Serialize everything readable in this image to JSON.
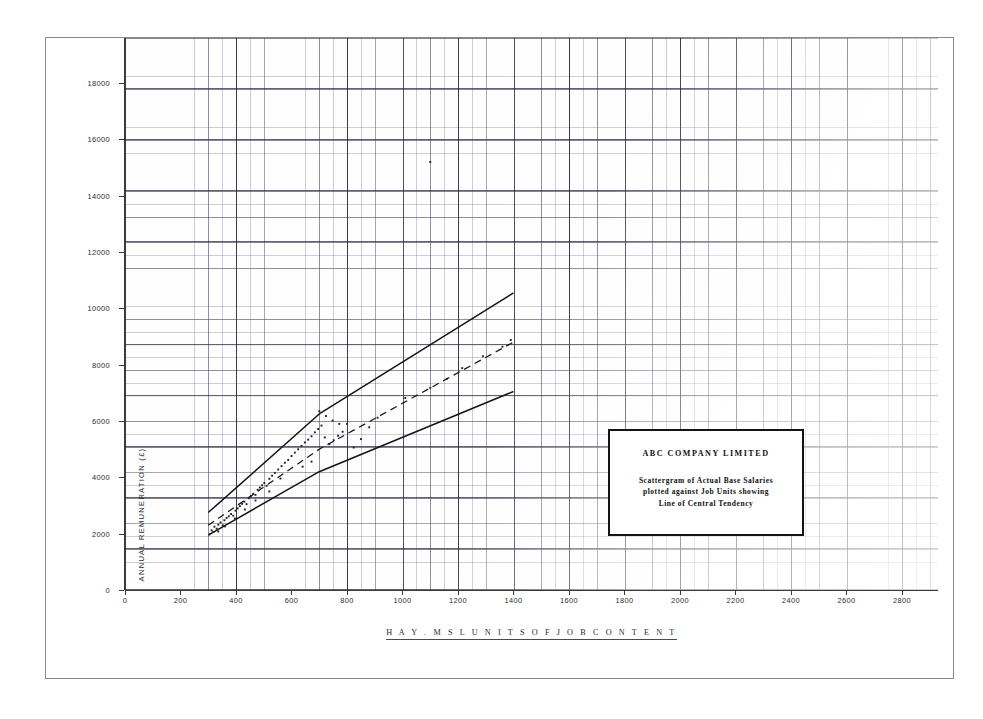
{
  "chart_data": {
    "type": "scatter",
    "title": "ABC COMPANY LIMITED",
    "xlabel": "H A Y . M S L   U N I T S   O F   J O B   C O N T E N T",
    "ylabel": "ANNUAL REMUNERATION (£)",
    "xlim": [
      0,
      2930
    ],
    "ylim": [
      0,
      19600
    ],
    "grid": true,
    "legend_position": "none",
    "x_ticks": [
      0,
      200,
      400,
      600,
      800,
      1000,
      1200,
      1400,
      1600,
      1800,
      2000,
      2200,
      2400,
      2600,
      2800
    ],
    "x_tick_labels": [
      "0",
      "200",
      "400",
      "600",
      "800",
      "1000",
      "1200",
      "1400",
      "1600",
      "1800",
      "2000",
      "2200",
      "2400",
      "2600",
      "2800"
    ],
    "y_ticks": [
      0,
      2000,
      4000,
      6000,
      8000,
      10000,
      12000,
      14000,
      16000,
      18000
    ],
    "y_tick_labels": [
      "0",
      "2000",
      "4000",
      "6000",
      "8000",
      "10000",
      "12000",
      "14000",
      "16000",
      "18000"
    ],
    "series": [
      {
        "name": "Upper Limit Line",
        "type": "line",
        "style": "solid",
        "points": [
          [
            300,
            2750
          ],
          [
            700,
            6250
          ],
          [
            1400,
            10550
          ]
        ]
      },
      {
        "name": "Line of Central Tendency",
        "type": "line",
        "style": "dashed",
        "points": [
          [
            300,
            2300
          ],
          [
            700,
            5000
          ],
          [
            1400,
            8800
          ]
        ]
      },
      {
        "name": "Lower Limit Line",
        "type": "line",
        "style": "solid",
        "points": [
          [
            300,
            1950
          ],
          [
            700,
            4200
          ],
          [
            1400,
            7050
          ]
        ]
      },
      {
        "name": "Actual Base Salaries",
        "type": "scatter",
        "points": [
          [
            305,
            1980
          ],
          [
            312,
            2120
          ],
          [
            318,
            2060
          ],
          [
            322,
            2250
          ],
          [
            330,
            2180
          ],
          [
            336,
            2320
          ],
          [
            344,
            2400
          ],
          [
            352,
            2300
          ],
          [
            358,
            2480
          ],
          [
            366,
            2560
          ],
          [
            374,
            2620
          ],
          [
            382,
            2700
          ],
          [
            390,
            2640
          ],
          [
            398,
            2820
          ],
          [
            406,
            2900
          ],
          [
            414,
            2980
          ],
          [
            422,
            3060
          ],
          [
            430,
            3140
          ],
          [
            438,
            3050
          ],
          [
            446,
            3260
          ],
          [
            454,
            3340
          ],
          [
            462,
            3420
          ],
          [
            470,
            3380
          ],
          [
            478,
            3560
          ],
          [
            486,
            3640
          ],
          [
            494,
            3720
          ],
          [
            502,
            3800
          ],
          [
            510,
            3700
          ],
          [
            520,
            3950
          ],
          [
            530,
            4060
          ],
          [
            540,
            4160
          ],
          [
            552,
            4280
          ],
          [
            564,
            4400
          ],
          [
            576,
            4520
          ],
          [
            588,
            4620
          ],
          [
            600,
            4760
          ],
          [
            612,
            4880
          ],
          [
            624,
            5000
          ],
          [
            636,
            5120
          ],
          [
            648,
            5240
          ],
          [
            660,
            5340
          ],
          [
            672,
            5460
          ],
          [
            684,
            5600
          ],
          [
            696,
            5720
          ],
          [
            708,
            5840
          ],
          [
            720,
            5420
          ],
          [
            736,
            5180
          ],
          [
            752,
            5320
          ],
          [
            768,
            5480
          ],
          [
            784,
            5620
          ],
          [
            800,
            5900
          ],
          [
            824,
            5060
          ],
          [
            850,
            5360
          ],
          [
            880,
            5780
          ],
          [
            910,
            6120
          ],
          [
            700,
            6350
          ],
          [
            724,
            6180
          ],
          [
            748,
            6020
          ],
          [
            772,
            5900
          ],
          [
            1010,
            6820
          ],
          [
            1100,
            7180
          ],
          [
            1160,
            7500
          ],
          [
            1215,
            7880
          ],
          [
            1290,
            8300
          ],
          [
            1360,
            8640
          ],
          [
            1100,
            15200
          ],
          [
            1390,
            8880
          ],
          [
            640,
            4380
          ],
          [
            672,
            4560
          ],
          [
            560,
            3960
          ],
          [
            520,
            3500
          ],
          [
            470,
            3180
          ],
          [
            432,
            2860
          ],
          [
            396,
            2540
          ],
          [
            360,
            2260
          ],
          [
            336,
            2080
          ]
        ]
      }
    ],
    "annotations": {
      "box_title": "ABC COMPANY LIMITED",
      "box_lines": [
        "Scattergram of Actual Base Salaries",
        "plotted against Job Units showing",
        "Line of Central Tendency"
      ]
    },
    "colors": {
      "line": "#151515",
      "point": "#222222",
      "grid_major": "#28283c",
      "grid_minor": "#6e6e82",
      "axis": "#3a3a3a",
      "frame": "#8a8a8a"
    }
  }
}
